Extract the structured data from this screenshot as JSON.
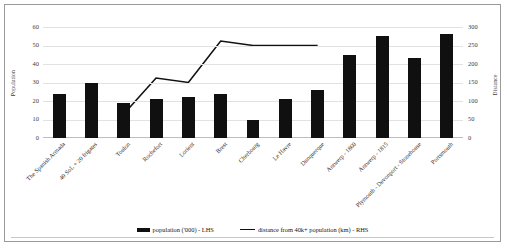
{
  "chart_data": {
    "type": "bar",
    "title": "",
    "subtitle": "",
    "xlabel": "",
    "categories": [
      "The Spanish Armada",
      "40 SoL + 20 frigates",
      "Toulon",
      "Rochefort",
      "Lorient",
      "Brest",
      "Cherbourg",
      "Le Havre",
      "Dunquerque",
      "Antwerp - 1860",
      "Antwerp - 1815",
      "Plymouth - Devonport - Stonehouse",
      "Portsmouth"
    ],
    "series": [
      {
        "name": "population ('000) - LHS",
        "type": "bar",
        "axis": "left",
        "color": "#101010",
        "values": [
          24,
          30,
          19,
          21,
          22,
          24,
          10,
          21,
          26,
          45,
          55,
          43,
          56
        ]
      },
      {
        "name": "distance from 40k+ population (km) - RHS",
        "type": "line",
        "axis": "right",
        "color": "#101010",
        "values": [
          null,
          null,
          65,
          162,
          150,
          262,
          250,
          250,
          250,
          null,
          null,
          null,
          null
        ]
      }
    ],
    "left_axis": {
      "label": "Population",
      "ticks": [
        0,
        10,
        20,
        30,
        40,
        50,
        60
      ],
      "ylim": [
        0,
        60
      ]
    },
    "right_axis": {
      "label": "Distance",
      "ticks": [
        0,
        50,
        100,
        150,
        200,
        250,
        300
      ],
      "ylim": [
        0,
        300
      ]
    },
    "grid": true,
    "legend_position": "bottom",
    "legend": [
      {
        "label": "population ('000) - LHS",
        "marker": "bar"
      },
      {
        "label": "distance from 40k+ population (km) - RHS",
        "marker": "line"
      }
    ]
  }
}
